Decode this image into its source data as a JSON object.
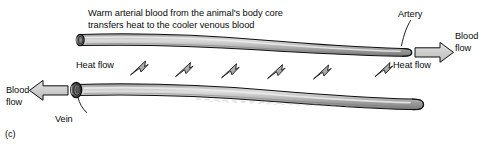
{
  "figure": {
    "panel_letter": "(c)",
    "type": "countercurrent-heat-exchange-diagram",
    "caption_line1": "Warm arterial blood from the animal's body core",
    "caption_line2": "transfers heat to the cooler venous blood",
    "labels": {
      "artery": "Artery",
      "vein": "Vein",
      "heat_flow_left": "Heat flow",
      "heat_flow_right": "Heat flow",
      "blood_flow_right_line1": "Blood",
      "blood_flow_right_line2": "flow",
      "blood_flow_left_line1": "Blood",
      "blood_flow_left_line2": "flow"
    },
    "vessels": [
      {
        "name": "artery",
        "position": "top",
        "flow_direction": "right",
        "blood_state": "warm arterial"
      },
      {
        "name": "vein",
        "position": "bottom",
        "flow_direction": "left",
        "blood_state": "cooler venous"
      }
    ],
    "heat_arrow_count": 6,
    "heat_arrow_direction": "up-right",
    "colors": {
      "vessel_fill_light": "#d8d8d8",
      "vessel_fill_mid": "#a8a8a8",
      "vessel_fill_dark": "#6e6e6e",
      "outline": "#000000",
      "flow_arrow_fill": "#cfcfcf",
      "heat_arrow_fill": "#b0b0b0",
      "background": "#ffffff",
      "text": "#000000"
    }
  }
}
